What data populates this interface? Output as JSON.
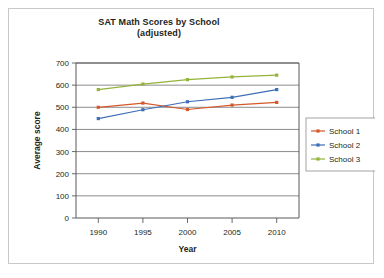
{
  "chart_data": {
    "type": "line",
    "title": "SAT Math Scores by School",
    "subtitle": "(adjusted)",
    "xlabel": "Year",
    "ylabel": "Average score",
    "categories": [
      "1990",
      "1995",
      "2000",
      "2005",
      "2010"
    ],
    "x": [
      1990,
      1995,
      2000,
      2005,
      2010
    ],
    "xlim": [
      1987.5,
      2012.5
    ],
    "ylim": [
      0,
      700
    ],
    "yticks": [
      0,
      100,
      200,
      300,
      400,
      500,
      600,
      700
    ],
    "ytick_labels": [
      "0",
      "100",
      "200",
      "300",
      "400",
      "500",
      "600",
      "700"
    ],
    "grid": "horizontal",
    "legend_position": "right",
    "markers": "square",
    "series": [
      {
        "name": "School 1",
        "color": "#d4582a",
        "values": [
          500,
          519,
          490,
          510,
          522
        ]
      },
      {
        "name": "School 2",
        "color": "#3e6fb5",
        "values": [
          449,
          489,
          525,
          545,
          580
        ]
      },
      {
        "name": "School 3",
        "color": "#94b33a",
        "values": [
          580,
          605,
          625,
          637,
          645
        ]
      }
    ]
  },
  "figure": {
    "background_color": "#ffffff",
    "border_color": "#c8c8c8",
    "axis_color": "#58595b",
    "gridline_color": "#6d6e71"
  }
}
